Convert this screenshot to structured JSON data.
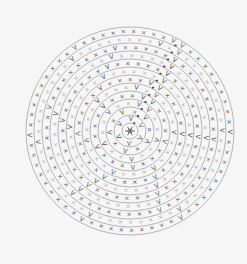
{
  "diagram": {
    "type": "crochet-round-chart",
    "center": [
      130,
      131
    ],
    "ring_count": 13,
    "ring_spacing": 8,
    "inner_radius": 8,
    "colors": {
      "background": "#f6f6f6",
      "ring_stroke": "#9a9a9a",
      "stitch_dark": "#555555",
      "stitch_light": "#b0b0b0",
      "seam": "#444444"
    },
    "legend_symbols": {
      "single_crochet": "×",
      "increase": "V",
      "decrease": "Λ",
      "slip_stitch": "•"
    },
    "seam_angle_deg": -62,
    "rounds": [
      {
        "round": 1,
        "stitches": 6,
        "shade": "dark",
        "increase_every": 1
      },
      {
        "round": 2,
        "stitches": 10,
        "shade": "dark",
        "increase_every": 2
      },
      {
        "round": 3,
        "stitches": 16,
        "shade": "light",
        "increase_every": 3
      },
      {
        "round": 4,
        "stitches": 21,
        "shade": "dark",
        "increase_every": 4
      },
      {
        "round": 5,
        "stitches": 26,
        "shade": "light",
        "increase_every": 5
      },
      {
        "round": 6,
        "stitches": 31,
        "shade": "dark",
        "increase_every": 6
      },
      {
        "round": 7,
        "stitches": 36,
        "shade": "light",
        "increase_every": 7
      },
      {
        "round": 8,
        "stitches": 41,
        "shade": "dark",
        "increase_every": 8
      },
      {
        "round": 9,
        "stitches": 46,
        "shade": "light",
        "increase_every": 9
      },
      {
        "round": 10,
        "stitches": 51,
        "shade": "dark",
        "increase_every": 10
      },
      {
        "round": 11,
        "stitches": 56,
        "shade": "light",
        "increase_every": 11
      },
      {
        "round": 12,
        "stitches": 61,
        "shade": "dark",
        "increase_every": 12
      }
    ]
  }
}
